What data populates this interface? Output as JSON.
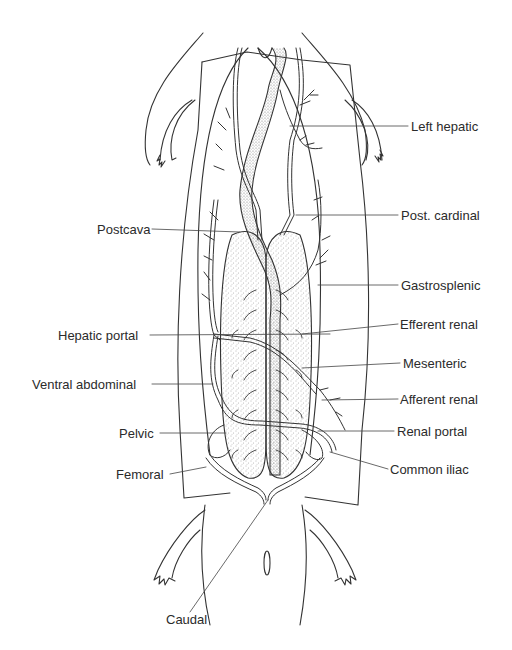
{
  "figure": {
    "stroke_color": "#333333",
    "stipple_color": "#6a6a6a",
    "background": "#ffffff"
  },
  "labels_left": [
    {
      "id": "postcava",
      "text": "Postcava",
      "x": 97,
      "y": 222,
      "line_to": [
        240,
        230
      ]
    },
    {
      "id": "hepatic-portal",
      "text": "Hepatic portal",
      "x": 58,
      "y": 328,
      "line_to": [
        330,
        334
      ]
    },
    {
      "id": "ventral-abdominal",
      "text": "Ventral abdominal",
      "x": 32,
      "y": 377,
      "line_to": [
        213,
        377
      ]
    },
    {
      "id": "pelvic",
      "text": "Pelvic",
      "x": 119,
      "y": 426,
      "line_to": [
        226,
        426
      ]
    },
    {
      "id": "femoral",
      "text": "Femoral",
      "x": 116,
      "y": 467,
      "line_to": [
        204,
        460
      ]
    }
  ],
  "labels_right": [
    {
      "id": "left-hepatic",
      "text": "Left hepatic",
      "x": 411,
      "y": 120,
      "line_from": [
        290,
        126
      ]
    },
    {
      "id": "post-cardinal",
      "text": "Post. cardinal",
      "x": 401,
      "y": 208,
      "line_from": [
        296,
        213
      ]
    },
    {
      "id": "gastrosplenic",
      "text": "Gastrosplenic",
      "x": 401,
      "y": 278,
      "line_from": [
        318,
        282
      ]
    },
    {
      "id": "efferent-renal",
      "text": "Efferent renal",
      "x": 400,
      "y": 317,
      "line_from": [
        302,
        331
      ]
    },
    {
      "id": "mesenteric",
      "text": "Mesenteric",
      "x": 403,
      "y": 356,
      "line_from": [
        302,
        365
      ]
    },
    {
      "id": "afferent-renal",
      "text": "Afferent renal",
      "x": 400,
      "y": 392,
      "line_from": [
        322,
        396
      ]
    },
    {
      "id": "renal-portal",
      "text": "Renal portal",
      "x": 397,
      "y": 424,
      "line_from": [
        318,
        428
      ]
    },
    {
      "id": "common-iliac",
      "text": "Common iliac",
      "x": 390,
      "y": 462,
      "line_from": [
        330,
        450
      ]
    }
  ],
  "labels_bottom": [
    {
      "id": "caudal",
      "text": "Caudal",
      "x": 166,
      "y": 612,
      "line_to": [
        268,
        490
      ]
    }
  ],
  "caption": {
    "text": "",
    "note": "caption partially cut off at bottom edge, illegible"
  }
}
